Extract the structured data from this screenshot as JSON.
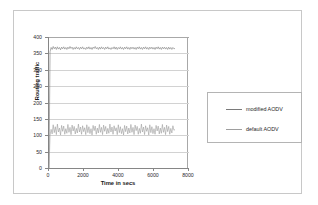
{
  "chart_data": {
    "type": "line",
    "title": "",
    "xlabel": "Time in secs",
    "ylabel": "Routing traffic",
    "xlim": [
      0,
      8000
    ],
    "ylim": [
      0,
      400
    ],
    "xticks": [
      0,
      2000,
      4000,
      6000,
      8000
    ],
    "yticks": [
      0,
      50,
      100,
      150,
      200,
      250,
      300,
      350,
      400
    ],
    "grid": "horizontal",
    "legend_position": "right-outside",
    "series": [
      {
        "name": "modified AODV",
        "color": "#7a7a7a",
        "x": [
          0,
          60,
          120,
          180,
          240,
          300,
          360,
          420,
          480,
          540,
          600,
          660,
          720,
          780,
          840,
          900,
          960,
          1020,
          1080,
          1140,
          1200,
          1260,
          1320,
          1380,
          1440,
          1500,
          1560,
          1620,
          1680,
          1740,
          1800,
          1860,
          1920,
          1980,
          2040,
          2100,
          2160,
          2220,
          2280,
          2340,
          2400,
          2460,
          2520,
          2580,
          2640,
          2700,
          2760,
          2820,
          2880,
          2940,
          3000,
          3060,
          3120,
          3180,
          3240,
          3300,
          3360,
          3420,
          3480,
          3540,
          3600,
          3660,
          3720,
          3780,
          3840,
          3900,
          3960,
          4020,
          4080,
          4140,
          4200,
          4260,
          4320,
          4380,
          4440,
          4500,
          4560,
          4620,
          4680,
          4740,
          4800,
          4860,
          4920,
          4980,
          5040,
          5100,
          5160,
          5220,
          5280,
          5340,
          5400,
          5460,
          5520,
          5580,
          5640,
          5700,
          5760,
          5820,
          5880,
          5940,
          6000,
          6060,
          6120,
          6180,
          6240,
          6300,
          6360,
          6420,
          6480,
          6540,
          6600,
          6660,
          6720,
          6780,
          6840,
          6900,
          6960,
          7020,
          7080,
          7140,
          7200
        ],
        "values": [
          0,
          355,
          368,
          362,
          371,
          364,
          369,
          362,
          370,
          363,
          368,
          361,
          369,
          364,
          370,
          363,
          368,
          362,
          369,
          364,
          371,
          365,
          369,
          362,
          368,
          363,
          370,
          364,
          368,
          362,
          369,
          364,
          370,
          363,
          367,
          362,
          369,
          364,
          370,
          363,
          368,
          362,
          369,
          365,
          371,
          364,
          368,
          362,
          369,
          363,
          370,
          364,
          368,
          362,
          369,
          364,
          370,
          363,
          367,
          362,
          368,
          364,
          370,
          363,
          369,
          362,
          368,
          364,
          370,
          363,
          368,
          362,
          369,
          364,
          370,
          363,
          368,
          362,
          369,
          364,
          369,
          363,
          368,
          362,
          369,
          364,
          370,
          363,
          368,
          362,
          369,
          364,
          370,
          363,
          368,
          362,
          369,
          364,
          369,
          363,
          368,
          362,
          369,
          364,
          370,
          363,
          368,
          362,
          369,
          364,
          369,
          363,
          368,
          362,
          369,
          363,
          368,
          362,
          368,
          364,
          365
        ]
      },
      {
        "name": "default AODV",
        "color": "#9e9e9e",
        "x": [
          0,
          60,
          120,
          180,
          240,
          300,
          360,
          420,
          480,
          540,
          600,
          660,
          720,
          780,
          840,
          900,
          960,
          1020,
          1080,
          1140,
          1200,
          1260,
          1320,
          1380,
          1440,
          1500,
          1560,
          1620,
          1680,
          1740,
          1800,
          1860,
          1920,
          1980,
          2040,
          2100,
          2160,
          2220,
          2280,
          2340,
          2400,
          2460,
          2520,
          2580,
          2640,
          2700,
          2760,
          2820,
          2880,
          2940,
          3000,
          3060,
          3120,
          3180,
          3240,
          3300,
          3360,
          3420,
          3480,
          3540,
          3600,
          3660,
          3720,
          3780,
          3840,
          3900,
          3960,
          4020,
          4080,
          4140,
          4200,
          4260,
          4320,
          4380,
          4440,
          4500,
          4560,
          4620,
          4680,
          4740,
          4800,
          4860,
          4920,
          4980,
          5040,
          5100,
          5160,
          5220,
          5280,
          5340,
          5400,
          5460,
          5520,
          5580,
          5640,
          5700,
          5760,
          5820,
          5880,
          5940,
          6000,
          6060,
          6120,
          6180,
          6240,
          6300,
          6360,
          6420,
          6480,
          6540,
          6600,
          6660,
          6720,
          6780,
          6840,
          6900,
          6960,
          7020,
          7080,
          7140,
          7200
        ],
        "values": [
          0,
          100,
          118,
          104,
          132,
          108,
          126,
          102,
          134,
          110,
          122,
          101,
          130,
          112,
          128,
          103,
          120,
          106,
          133,
          109,
          124,
          102,
          131,
          113,
          127,
          104,
          121,
          107,
          134,
          110,
          125,
          103,
          129,
          111,
          123,
          102,
          132,
          108,
          126,
          105,
          120,
          101,
          130,
          114,
          128,
          103,
          122,
          107,
          133,
          109,
          124,
          102,
          131,
          112,
          127,
          104,
          121,
          106,
          134,
          110,
          125,
          103,
          129,
          113,
          123,
          102,
          132,
          108,
          126,
          105,
          120,
          101,
          130,
          111,
          128,
          104,
          122,
          107,
          133,
          109,
          124,
          102,
          131,
          114,
          127,
          103,
          121,
          106,
          134,
          110,
          125,
          102,
          129,
          112,
          123,
          101,
          132,
          108,
          126,
          105,
          120,
          103,
          130,
          113,
          128,
          104,
          122,
          106,
          133,
          109,
          124,
          102,
          131,
          111,
          127,
          103,
          121,
          107,
          129,
          115,
          118
        ]
      }
    ]
  },
  "axes": {
    "ylabel": "Routing traffic",
    "xlabel": "Time in secs"
  },
  "legend": {
    "entries": [
      {
        "label": "modified AODV"
      },
      {
        "label": "default AODV"
      }
    ]
  }
}
